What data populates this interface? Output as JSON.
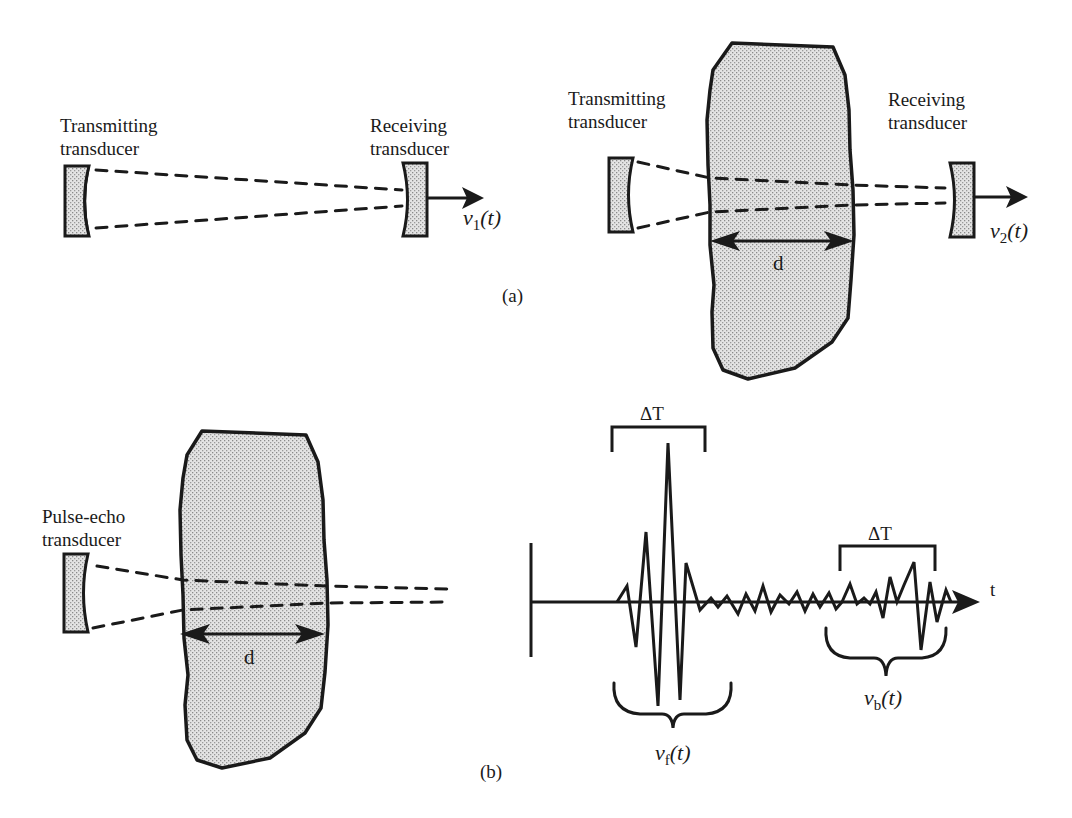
{
  "figure": {
    "panel_a": {
      "label": "(a)",
      "left_setup": {
        "transmitter_label_line1": "Transmitting",
        "transmitter_label_line2": "transducer",
        "receiver_label_line1": "Receiving",
        "receiver_label_line2": "transducer",
        "output_signal": "v",
        "output_signal_sub": "1",
        "output_signal_arg": "(t)"
      },
      "right_setup": {
        "transmitter_label_line1": "Transmitting",
        "transmitter_label_line2": "transducer",
        "receiver_label_line1": "Receiving",
        "receiver_label_line2": "transducer",
        "sample_thickness_label": "d",
        "output_signal": "v",
        "output_signal_sub": "2",
        "output_signal_arg": "(t)"
      }
    },
    "panel_b": {
      "label": "(b)",
      "transducer_label_line1": "Pulse-echo",
      "transducer_label_line2": "transducer",
      "sample_thickness_label": "d",
      "waveform": {
        "time_axis_label": "t",
        "front_window_label": "ΔT",
        "back_window_label": "ΔT",
        "front_echo_signal": "v",
        "front_echo_sub": "f",
        "front_echo_arg": "(t)",
        "back_echo_signal": "v",
        "back_echo_sub": "b",
        "back_echo_arg": "(t)"
      }
    }
  },
  "colors": {
    "ink": "#1a1a1a",
    "stipple_fill": "#d9d9d9",
    "background": "#ffffff"
  }
}
